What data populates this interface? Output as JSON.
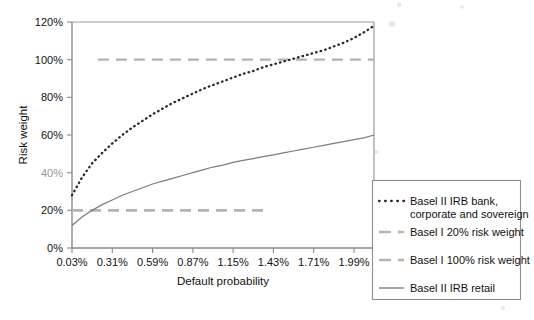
{
  "chart_data": {
    "type": "line",
    "title": "",
    "xlabel": "Default probability",
    "ylabel": "Risk weight",
    "x_tick_labels": [
      "0.03%",
      "0.31%",
      "0.59%",
      "0.87%",
      "1.15%",
      "1.43%",
      "1.71%",
      "1.99%"
    ],
    "x_tick_values": [
      0.03,
      0.31,
      0.59,
      0.87,
      1.15,
      1.43,
      1.71,
      1.99
    ],
    "y_tick_labels": [
      "0%",
      "20%",
      "40%",
      "60%",
      "80%",
      "100%",
      "120%"
    ],
    "y_tick_values": [
      0,
      20,
      40,
      60,
      80,
      100,
      120
    ],
    "xlim": [
      0.03,
      2.13
    ],
    "ylim": [
      0,
      120
    ],
    "grid": false,
    "legend_position": "outside-right-bottom",
    "series": [
      {
        "name": "Basel II IRB bank, corporate and sovereign",
        "style": "dotted",
        "color": "#2b2b2b",
        "x": [
          0.03,
          0.1,
          0.17,
          0.24,
          0.31,
          0.38,
          0.45,
          0.52,
          0.59,
          0.66,
          0.73,
          0.8,
          0.87,
          0.94,
          1.01,
          1.08,
          1.15,
          1.22,
          1.29,
          1.36,
          1.43,
          1.5,
          1.57,
          1.64,
          1.71,
          1.78,
          1.85,
          1.92,
          1.99,
          2.06,
          2.13
        ],
        "y": [
          28.0,
          37.5,
          45.0,
          50.5,
          55.5,
          60.0,
          64.0,
          67.5,
          71.0,
          74.0,
          77.0,
          79.5,
          82.0,
          84.5,
          86.5,
          88.5,
          90.5,
          92.5,
          94.0,
          96.0,
          97.5,
          99.0,
          100.5,
          102.0,
          103.5,
          105.0,
          107.0,
          109.0,
          111.5,
          114.5,
          118.0
        ]
      },
      {
        "name": "Basel II IRB retail",
        "style": "solid",
        "color": "#7d7d7d",
        "x": [
          0.03,
          0.1,
          0.17,
          0.24,
          0.31,
          0.38,
          0.45,
          0.52,
          0.59,
          0.66,
          0.73,
          0.8,
          0.87,
          0.94,
          1.01,
          1.08,
          1.15,
          1.22,
          1.29,
          1.36,
          1.43,
          1.5,
          1.57,
          1.64,
          1.71,
          1.78,
          1.85,
          1.92,
          1.99,
          2.06,
          2.13
        ],
        "y": [
          12.0,
          16.5,
          20.0,
          23.0,
          25.5,
          28.0,
          30.0,
          32.0,
          34.0,
          35.5,
          37.0,
          38.5,
          40.0,
          41.5,
          43.0,
          44.0,
          45.5,
          46.5,
          47.5,
          48.5,
          49.5,
          50.5,
          51.5,
          52.5,
          53.5,
          54.5,
          55.5,
          56.5,
          57.5,
          58.5,
          60.0
        ]
      },
      {
        "name": "Basel I 20% risk weight",
        "style": "dashed",
        "color": "#b4b4b4",
        "constant_value": 20,
        "x_start": 0.03,
        "x_end": 1.39
      },
      {
        "name": "Basel I 100% risk weight",
        "style": "dashed",
        "color": "#b4b4b4",
        "constant_value": 100,
        "x_start": 0.21,
        "x_end": 2.13
      }
    ]
  },
  "axes": {
    "y_axis_title": "Risk weight",
    "x_axis_title": "Default probability",
    "y_ticks": [
      {
        "label": "120%",
        "value": 120
      },
      {
        "label": "100%",
        "value": 100
      },
      {
        "label": "80%",
        "value": 80
      },
      {
        "label": "60%",
        "value": 60
      },
      {
        "label": "40%",
        "value": 40
      },
      {
        "label": "20%",
        "value": 20
      },
      {
        "label": "0%",
        "value": 0
      }
    ],
    "x_ticks": [
      {
        "label": "0.03%",
        "value": 0.03
      },
      {
        "label": "0.31%",
        "value": 0.31
      },
      {
        "label": "0.59%",
        "value": 0.59
      },
      {
        "label": "0.87%",
        "value": 0.87
      },
      {
        "label": "1.15%",
        "value": 1.15
      },
      {
        "label": "1.43%",
        "value": 1.43
      },
      {
        "label": "1.71%",
        "value": 1.71
      },
      {
        "label": "1.99%",
        "value": 1.99
      }
    ]
  },
  "legend": {
    "entries": [
      {
        "label_line1": "Basel II IRB bank,",
        "label_line2": "corporate and sovereign",
        "marker": "dotted",
        "color": "#2b2b2b"
      },
      {
        "label_line1": "Basel I 20% risk weight",
        "label_line2": "",
        "marker": "dashed",
        "color": "#b4b4b4"
      },
      {
        "label_line1": "Basel I 100% risk weight",
        "label_line2": "",
        "marker": "dashed",
        "color": "#b4b4b4"
      },
      {
        "label_line1": "Basel II IRB retail",
        "label_line2": "",
        "marker": "solid",
        "color": "#7d7d7d"
      }
    ]
  }
}
